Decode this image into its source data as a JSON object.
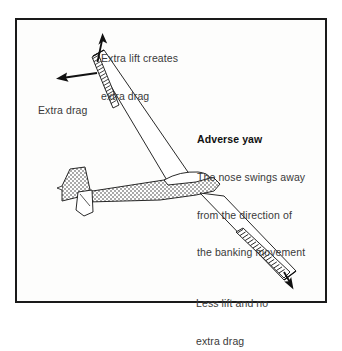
{
  "figure": {
    "domain": "diagram",
    "frame_color": "#1a1a1a",
    "background_color": "#ffffff",
    "ink_color": "#111111",
    "text_color": "#3a3a3a"
  },
  "annotations": {
    "extra_lift": {
      "line1": "Extra lift creates",
      "line2": "extra drag"
    },
    "extra_drag": {
      "line1": "Extra drag"
    },
    "adverse_yaw": {
      "title": "Adverse yaw",
      "line1": "The nose swings away",
      "line2": "from the direction of",
      "line3": "the banking movement"
    },
    "less_lift": {
      "line1": "Less lift and no",
      "line2": "extra drag"
    }
  },
  "icons": {
    "lift_arrow": "up-arrow-icon",
    "drag_arrow": "left-arrow-icon",
    "descent_arrow": "down-right-arrow-icon"
  },
  "parts": {
    "upper_wing": "upper-wing",
    "lower_wing": "lower-wing",
    "upper_aileron": "upper-aileron",
    "lower_aileron": "lower-aileron",
    "fuselage": "fuselage",
    "canopy": "canopy",
    "tail_fin": "tail-fin",
    "tailplane": "tailplane"
  }
}
